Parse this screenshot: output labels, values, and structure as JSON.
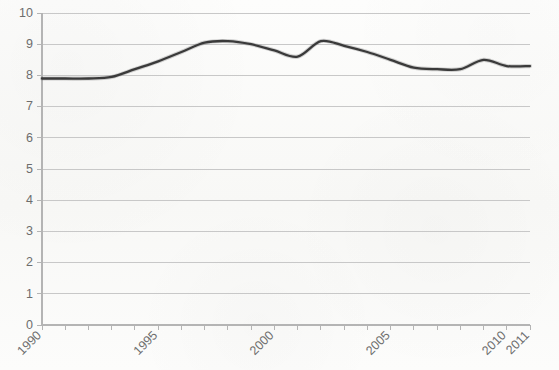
{
  "chart_data": {
    "type": "line",
    "title": "",
    "subtitle": "",
    "xlabel": "",
    "ylabel": "",
    "x": [
      1990,
      1991,
      1992,
      1993,
      1994,
      1995,
      1996,
      1997,
      1998,
      1999,
      2000,
      2001,
      2002,
      2003,
      2004,
      2005,
      2006,
      2007,
      2008,
      2009,
      2010,
      2011
    ],
    "values": [
      7.9,
      7.9,
      7.9,
      7.95,
      8.2,
      8.45,
      8.75,
      9.05,
      9.1,
      9.0,
      8.8,
      8.6,
      9.1,
      8.95,
      8.75,
      8.5,
      8.25,
      8.2,
      8.2,
      8.5,
      8.3,
      8.3
    ],
    "series": [
      {
        "name": "",
        "values": [
          7.9,
          7.9,
          7.9,
          7.95,
          8.2,
          8.45,
          8.75,
          9.05,
          9.1,
          9.0,
          8.8,
          8.6,
          9.1,
          8.95,
          8.75,
          8.5,
          8.25,
          8.2,
          8.2,
          8.5,
          8.3,
          8.3
        ],
        "color": "#3a3a3a"
      }
    ],
    "ylim": [
      0,
      10
    ],
    "xlim": [
      1990,
      2011
    ],
    "y_ticks": [
      0,
      1,
      2,
      3,
      4,
      5,
      6,
      7,
      8,
      9,
      10
    ],
    "y_tick_labels": [
      "0",
      "1",
      "2",
      "3",
      "4",
      "5",
      "6",
      "7",
      "8",
      "9",
      "10"
    ],
    "x_tick_labels": [
      "1990",
      "1995",
      "2000",
      "2005",
      "2010",
      "2011"
    ],
    "x_tick_label_years": [
      1990,
      1995,
      2000,
      2005,
      2010,
      2011
    ],
    "x_tick_label_rotation": -45,
    "grid": true,
    "grid_axis": "y",
    "legend": false,
    "legend_position": "none",
    "annotations": [],
    "colors": {
      "line": "#3a3a3a",
      "grid": "#c8c8c8",
      "axis": "#b4b4b4",
      "tick_text": "#6d6d6d",
      "background": "#fbfbfa"
    }
  },
  "figure": {
    "plot_left_px": 42,
    "plot_right_px": 530,
    "plot_top_px": 13,
    "plot_bottom_px": 325
  }
}
